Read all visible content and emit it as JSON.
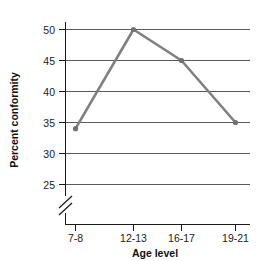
{
  "chart_data": {
    "type": "line",
    "title": "",
    "xlabel": "Age level",
    "ylabel": "Percent conformity",
    "categories": [
      "7-8",
      "12-13",
      "16-17",
      "19-21"
    ],
    "values": [
      34,
      50,
      45,
      35
    ],
    "series": [
      {
        "name": "Percent conformity",
        "values": [
          34,
          50,
          45,
          35
        ]
      }
    ],
    "ylim": [
      25,
      50
    ],
    "yticks": [
      25,
      30,
      35,
      40,
      45,
      50
    ],
    "ytick_labels": [
      "25",
      "30",
      "35",
      "40",
      "45",
      "50"
    ],
    "xtick_labels": [
      "7-8",
      "12-13",
      "16-17",
      "19-21"
    ],
    "grid": true,
    "grid_axis": "y",
    "legend": false,
    "legend_position": "none",
    "y_axis_break": true,
    "y_axis_break_note": "axis break below 25",
    "marker": "circle",
    "colors": {
      "line": "#808080",
      "marker": "#707070",
      "grid": "#5a5a5a",
      "axis": "#1a1a1a",
      "text": "#111111",
      "background": "#ffffff"
    }
  },
  "labels": {
    "y_tick_50": "50",
    "y_tick_45": "45",
    "y_tick_40": "40",
    "y_tick_35": "35",
    "y_tick_30": "30",
    "y_tick_25": "25",
    "x_tick_0": "7-8",
    "x_tick_1": "12-13",
    "x_tick_2": "16-17",
    "x_tick_3": "19-21",
    "x_axis_title": "Age level",
    "y_axis_title": "Percent conformity"
  }
}
